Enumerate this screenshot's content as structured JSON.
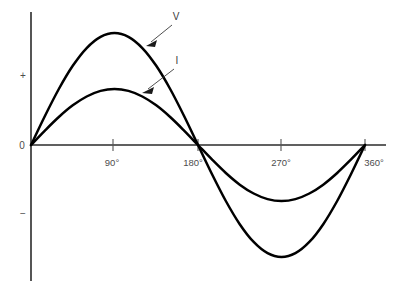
{
  "chart_data": {
    "type": "line",
    "title": "",
    "xlabel": "",
    "ylabel": "",
    "xlim": [
      0,
      360
    ],
    "ylim": [
      -1.25,
      1.25
    ],
    "grid": false,
    "legend_position": "inline-annotations",
    "x_tick_labels": [
      "90°",
      "180°",
      "270°",
      "360°"
    ],
    "x_tick_values": [
      90,
      180,
      270,
      360
    ],
    "y_tick_labels": [
      "+",
      "0",
      "−"
    ],
    "y_tick_values": [
      1,
      0,
      -1
    ],
    "annotations": [
      {
        "text": "V",
        "target_series": "V"
      },
      {
        "text": "I",
        "target_series": "I"
      }
    ],
    "x": [
      0,
      15,
      30,
      45,
      60,
      75,
      90,
      105,
      120,
      135,
      150,
      165,
      180,
      195,
      210,
      225,
      240,
      255,
      270,
      285,
      300,
      315,
      330,
      345,
      360
    ],
    "series": [
      {
        "name": "V",
        "amplitude": 1.0,
        "color": "#000000",
        "values": [
          0,
          0.259,
          0.5,
          0.707,
          0.866,
          0.966,
          1.0,
          0.966,
          0.866,
          0.707,
          0.5,
          0.259,
          0,
          -0.259,
          -0.5,
          -0.707,
          -0.866,
          -0.966,
          -1.0,
          -0.966,
          -0.866,
          -0.707,
          -0.5,
          -0.259,
          0
        ]
      },
      {
        "name": "I",
        "amplitude": 0.5,
        "color": "#000000",
        "values": [
          0,
          0.129,
          0.25,
          0.354,
          0.433,
          0.483,
          0.5,
          0.483,
          0.433,
          0.354,
          0.25,
          0.129,
          0,
          -0.129,
          -0.25,
          -0.354,
          -0.433,
          -0.483,
          -0.5,
          -0.483,
          -0.433,
          -0.354,
          -0.25,
          -0.129,
          0
        ]
      }
    ]
  },
  "axes": {
    "y_plus_label": "+",
    "y_zero_label": "0",
    "y_minus_label": "−",
    "x_labels": {
      "deg90": "90°",
      "deg180": "180°",
      "deg270": "270°",
      "deg360": "360°"
    }
  },
  "labels": {
    "voltage": "V",
    "current": "I"
  },
  "colors": {
    "curve": "#000000",
    "axis": "#2b2b2b",
    "text": "#4d4d4d",
    "background": "#ffffff"
  }
}
